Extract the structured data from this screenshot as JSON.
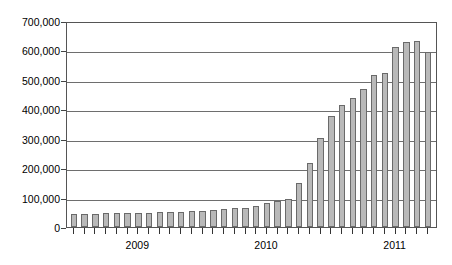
{
  "chart_data": {
    "type": "bar",
    "title": "",
    "subtitle": "",
    "xlabel": "",
    "ylabel": "",
    "ylim": [
      0,
      700000
    ],
    "ytick_step": 100000,
    "grid": true,
    "legend": null,
    "bar_fill_color": "#b9b9b9",
    "bar_border_color": "#6a6a6a",
    "gridline_color": "#6e6e6e",
    "axis_color": "#555555",
    "ytick_labels": [
      "700,000",
      "600,000",
      "500,000",
      "400,000",
      "300,000",
      "200,000",
      "100,000",
      "0"
    ],
    "ytick_values": [
      700000,
      600000,
      500000,
      400000,
      300000,
      200000,
      100000,
      0
    ],
    "year_labels": [
      "2009",
      "2010",
      "2011"
    ],
    "year_label_positions": [
      6,
      18,
      30
    ],
    "categories": [
      "2009-01",
      "2009-02",
      "2009-03",
      "2009-04",
      "2009-05",
      "2009-06",
      "2009-07",
      "2009-08",
      "2009-09",
      "2009-10",
      "2009-11",
      "2009-12",
      "2010-01",
      "2010-02",
      "2010-03",
      "2010-04",
      "2010-05",
      "2010-06",
      "2010-07",
      "2010-08",
      "2010-09",
      "2010-10",
      "2010-11",
      "2010-12",
      "2011-01",
      "2011-02",
      "2011-03",
      "2011-04",
      "2011-05",
      "2011-06",
      "2011-07",
      "2011-08",
      "2011-09",
      "2011-10"
    ],
    "values": [
      45000,
      44000,
      45000,
      46000,
      47000,
      47000,
      48000,
      49000,
      50000,
      51000,
      52000,
      53000,
      55000,
      57000,
      60000,
      63000,
      66000,
      72000,
      80000,
      88000,
      95000,
      148000,
      218000,
      302000,
      378000,
      413000,
      440000,
      470000,
      518000,
      525000,
      613000,
      628000,
      633000,
      595000
    ]
  }
}
